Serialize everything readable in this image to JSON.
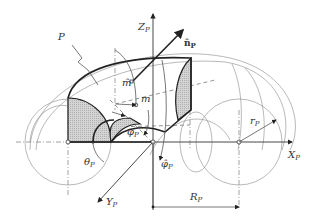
{
  "figure": {
    "labels": {
      "surface": "P",
      "z_axis": "Z",
      "z_axis_sub": "P",
      "x_axis": "X",
      "x_axis_sub": "P",
      "y_axis": "Y",
      "y_axis_sub": "P",
      "normal": "n̂",
      "normal_sub": "P",
      "point_m": "m",
      "point_m_hat": "m̂",
      "phi": "φ",
      "phi_sub": "P",
      "phi_hat": "φ̂",
      "phi_hat_sub": "P",
      "theta": "θ",
      "theta_sub": "P",
      "minor_radius": "r",
      "minor_radius_sub": "P",
      "major_radius": "R",
      "major_radius_sub": "P"
    },
    "colors": {
      "line": "#222222",
      "thin_line": "#8a8a8a",
      "hatch": "#c8c8c8",
      "background": "#ffffff"
    }
  }
}
